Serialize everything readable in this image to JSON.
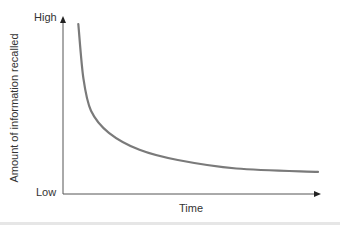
{
  "chart_data": {
    "type": "line",
    "title": "",
    "xlabel": "Time",
    "ylabel": "Amount of information recalled",
    "y_tick_labels": [
      "Low",
      "High"
    ],
    "x_tick_labels": [],
    "grid": false,
    "legend": null,
    "series": [
      {
        "name": "Forgetting curve",
        "description": "Steep initial decline in recall that levels off over time",
        "x": [
          0.06,
          0.08,
          0.11,
          0.18,
          0.3,
          0.45,
          0.68,
          1.0
        ],
        "values": [
          1.0,
          0.68,
          0.49,
          0.36,
          0.26,
          0.2,
          0.15,
          0.13
        ]
      }
    ],
    "xlim": [
      0,
      1
    ],
    "ylim": [
      0,
      1
    ]
  },
  "colors": {
    "curve": "#7a7a7a",
    "axis": "#555555",
    "text": "#333333"
  }
}
